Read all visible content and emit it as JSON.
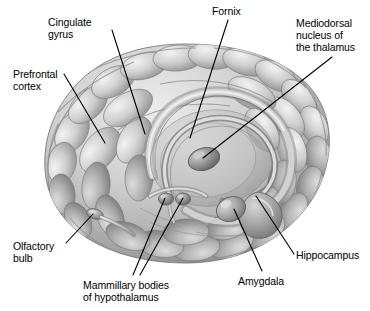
{
  "figure": {
    "view": "anterolateral oblique view of a translucent brain showing internal limbic structures",
    "background_color": "#ffffff",
    "line_color": "#000000",
    "text_color": "#000000",
    "brain_palette": {
      "highlight": "#f2f2f2",
      "light": "#d8d8d8",
      "mid": "#b4b4b4",
      "shadow": "#8c8c8c",
      "deep_shadow": "#6e6e6e",
      "outline": "#5a5a5a"
    }
  },
  "labels": [
    {
      "id": "cingulate-gyrus",
      "lines": [
        "Cingulate",
        "gyrus"
      ],
      "x": 48,
      "y": 16,
      "align": "left"
    },
    {
      "id": "prefrontal-cortex",
      "lines": [
        "Prefrontal",
        "cortex"
      ],
      "x": 13,
      "y": 68,
      "align": "left"
    },
    {
      "id": "fornix",
      "lines": [
        "Fornix"
      ],
      "x": 212,
      "y": 5,
      "align": "left"
    },
    {
      "id": "mediodorsal-nucleus-of-the-thalamus",
      "lines": [
        "Mediodorsal",
        "nucleus of",
        "the thalamus"
      ],
      "x": 296,
      "y": 17,
      "align": "left"
    },
    {
      "id": "olfactory-bulb",
      "lines": [
        "Olfactory",
        "bulb"
      ],
      "x": 13,
      "y": 240,
      "align": "left"
    },
    {
      "id": "mammillary-bodies-of-hypothalamus",
      "lines": [
        "Mammillary bodies",
        "of hypothalamus"
      ],
      "x": 83,
      "y": 279,
      "align": "left"
    },
    {
      "id": "amygdala",
      "lines": [
        "Amygdala"
      ],
      "x": 238,
      "y": 275,
      "align": "left"
    },
    {
      "id": "hippocampus",
      "lines": [
        "Hippocampus"
      ],
      "x": 296,
      "y": 249,
      "align": "left"
    }
  ],
  "leaders": [
    {
      "id": "leader-cingulate-gyrus",
      "points": "112,30 145,134"
    },
    {
      "id": "leader-prefrontal-cortex",
      "points": "64,74 105,143"
    },
    {
      "id": "leader-fornix",
      "points": "228,20 190,138"
    },
    {
      "id": "leader-mediodorsal-thalamus",
      "points": "332,57 203,158"
    },
    {
      "id": "leader-olfactory-bulb",
      "points": "66,243 93,214"
    },
    {
      "id": "leader-mammillary-left",
      "points": "133,275 165,198"
    },
    {
      "id": "leader-mammillary-right",
      "points": "140,275 183,198"
    },
    {
      "id": "leader-amygdala",
      "points": "262,271 234,209"
    },
    {
      "id": "leader-hippocampus",
      "points": "294,254 256,196"
    }
  ],
  "structures": [
    {
      "id": "brain-outline",
      "name": "cerebral hemisphere surface"
    },
    {
      "id": "cingulate-gyrus-band",
      "name": "cingulate gyrus band"
    },
    {
      "id": "fornix-arch",
      "name": "fornix arch"
    },
    {
      "id": "thalamus-body",
      "name": "mediodorsal nucleus of thalamus"
    },
    {
      "id": "mammillary-bodies",
      "name": "mammillary bodies"
    },
    {
      "id": "amygdala-body",
      "name": "amygdala"
    },
    {
      "id": "hippocampus-body",
      "name": "hippocampus"
    },
    {
      "id": "olfactory-bulb-body",
      "name": "olfactory bulb and tract"
    }
  ]
}
